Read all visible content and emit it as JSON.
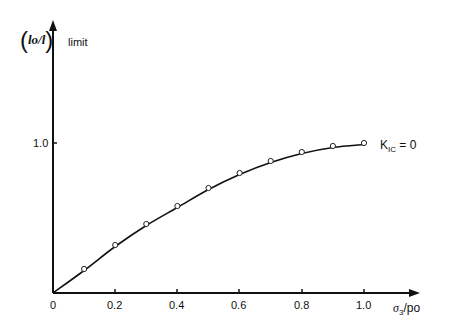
{
  "chart_data": {
    "type": "line",
    "title": "",
    "xlabel": "σ3/po",
    "ylabel": "(lo/l) limit",
    "x_ticks": [
      "0",
      "0.2",
      "0.4",
      "0.6",
      "0.8",
      "1.0"
    ],
    "y_ticks": [
      "1.0"
    ],
    "xlim": [
      0,
      1.0
    ],
    "ylim": [
      0,
      1.0
    ],
    "grid": false,
    "series": [
      {
        "name": "KIC = 0",
        "marker": "open-circle",
        "x": [
          0.1,
          0.2,
          0.3,
          0.4,
          0.5,
          0.6,
          0.7,
          0.8,
          0.9,
          1.0
        ],
        "y": [
          0.15,
          0.31,
          0.45,
          0.57,
          0.69,
          0.79,
          0.87,
          0.93,
          0.97,
          0.99
        ]
      }
    ],
    "annotations": [
      "KIC = 0"
    ]
  },
  "labels": {
    "y_frac": "lo/l",
    "y_suffix": "limit",
    "x_sigma": "σ",
    "x_sub": "3",
    "x_rest": "/po",
    "curve_k": "K",
    "curve_sub": "IC",
    "curve_rest": " = 0",
    "origin": "0",
    "xt1": "0.2",
    "xt2": "0.4",
    "xt3": "0.6",
    "xt4": "0.8",
    "xt5": "1.0",
    "yt1": "1.0"
  }
}
